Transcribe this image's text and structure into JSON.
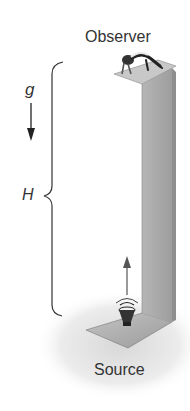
{
  "diagram": {
    "labels": {
      "observer": "Observer",
      "source": "Source",
      "gravity": "g",
      "height": "H"
    },
    "colors": {
      "pillar_front": "#a8a8a8",
      "pillar_side": "#cfcfcf",
      "platform_top": "#bdbdbd",
      "shadow": "#e6e6e6",
      "ink": "#222222",
      "text": "#333333"
    },
    "icons": {
      "gravity_arrow": "arrow-down-icon",
      "sound_direction_arrow": "arrow-up-icon",
      "speaker": "speaker-icon",
      "observer_figure": "person-lying-icon",
      "height_brace": "curly-brace-icon"
    }
  }
}
